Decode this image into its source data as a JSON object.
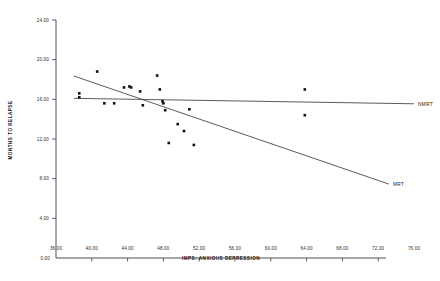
{
  "chart_data": {
    "type": "scatter",
    "title": "",
    "xlabel": "IMPS:  ANXIOUS DEPRESSION",
    "ylabel": "MONTHS TO RELAPSE",
    "xlim": [
      36.0,
      76.0
    ],
    "ylim": [
      0.0,
      24.0
    ],
    "xticks": [
      "36.00",
      "40.00",
      "44.00",
      "48.00",
      "52.00",
      "56.00",
      "60.00",
      "64.00",
      "68.00",
      "72.00",
      "76.00"
    ],
    "xtick_values": [
      36,
      40,
      44,
      48,
      52,
      56,
      60,
      64,
      68,
      72,
      76
    ],
    "yticks": [
      "24.00",
      "20.00",
      "16.00",
      "12.00",
      "8.00",
      "4.00",
      "0.00"
    ],
    "ytick_values": [
      24,
      20,
      16,
      12,
      8,
      4,
      0
    ],
    "grid": false,
    "legend_position": "right-inline",
    "points": [
      {
        "x": 38.6,
        "y": 16.6
      },
      {
        "x": 38.6,
        "y": 16.2
      },
      {
        "x": 40.6,
        "y": 18.8
      },
      {
        "x": 41.4,
        "y": 15.6
      },
      {
        "x": 42.5,
        "y": 15.6
      },
      {
        "x": 43.6,
        "y": 17.2
      },
      {
        "x": 44.2,
        "y": 17.3
      },
      {
        "x": 44.4,
        "y": 17.2
      },
      {
        "x": 45.4,
        "y": 16.8
      },
      {
        "x": 45.7,
        "y": 15.4
      },
      {
        "x": 47.3,
        "y": 18.4
      },
      {
        "x": 47.6,
        "y": 17.0
      },
      {
        "x": 47.9,
        "y": 15.8
      },
      {
        "x": 48.0,
        "y": 15.6
      },
      {
        "x": 48.2,
        "y": 14.9
      },
      {
        "x": 48.6,
        "y": 11.6
      },
      {
        "x": 49.6,
        "y": 13.5
      },
      {
        "x": 50.3,
        "y": 12.8
      },
      {
        "x": 50.9,
        "y": 15.0
      },
      {
        "x": 51.4,
        "y": 11.4
      },
      {
        "x": 63.8,
        "y": 17.0
      },
      {
        "x": 63.8,
        "y": 14.4
      }
    ],
    "lines": [
      {
        "name": "NMRT",
        "label": "NMRT",
        "x_start": 38.0,
        "y_start": 16.1,
        "x_end": 76.0,
        "y_end": 15.55
      },
      {
        "name": "MRT",
        "label": "MRT",
        "x_start": 38.0,
        "y_start": 18.35,
        "x_end": 73.2,
        "y_end": 7.45
      }
    ],
    "series_labels": [
      "NMRT",
      "MRT"
    ]
  }
}
